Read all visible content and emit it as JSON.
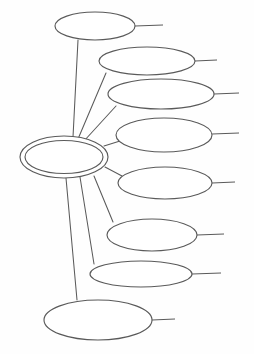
{
  "document": {
    "title": "Blank Concept Map",
    "type": "spider-diagram",
    "background_color": "#fefefe",
    "stroke_color": "#5a5a5a",
    "fill_color": "#ffffff"
  },
  "hub": {
    "label": "",
    "shape": "double-ellipse",
    "cx": 64,
    "cy": 157,
    "rx_outer": 44,
    "ry_outer": 21,
    "rx_inner": 39,
    "ry_inner": 16.5
  },
  "branches": [
    {
      "id": "branch-1",
      "label": "",
      "cx": 95,
      "cy": 26,
      "rx": 40,
      "ry": 14,
      "tail_x1": 135,
      "tail_y1": 26,
      "tail_x2": 163,
      "tail_y2": 25,
      "edge_x1": 73,
      "edge_y1": 137,
      "edge_x2": 78,
      "edge_y2": 40
    },
    {
      "id": "branch-2",
      "label": "",
      "cx": 147,
      "cy": 61,
      "rx": 48,
      "ry": 14,
      "tail_x1": 195,
      "tail_y1": 61,
      "tail_x2": 217,
      "tail_y2": 60,
      "edge_x1": 78,
      "edge_y1": 139,
      "edge_x2": 106,
      "edge_y2": 73
    },
    {
      "id": "branch-3",
      "label": "",
      "cx": 161,
      "cy": 94,
      "rx": 53,
      "ry": 15,
      "tail_x1": 214,
      "tail_y1": 94,
      "tail_x2": 239,
      "tail_y2": 93,
      "edge_x1": 84,
      "edge_y1": 141,
      "edge_x2": 116,
      "edge_y2": 106
    },
    {
      "id": "branch-4",
      "label": "",
      "cx": 164,
      "cy": 135,
      "rx": 48,
      "ry": 17,
      "tail_x1": 212,
      "tail_y1": 134,
      "tail_x2": 239,
      "tail_y2": 133,
      "edge_x1": 104,
      "edge_y1": 146,
      "edge_x2": 120,
      "edge_y2": 141
    },
    {
      "id": "branch-5",
      "label": "",
      "cx": 165,
      "cy": 183,
      "rx": 47,
      "ry": 16,
      "tail_x1": 212,
      "tail_y1": 183,
      "tail_x2": 235,
      "tail_y2": 182,
      "edge_x1": 105,
      "edge_y1": 167,
      "edge_x2": 122,
      "edge_y2": 176
    },
    {
      "id": "branch-6",
      "label": "",
      "cx": 152,
      "cy": 235,
      "rx": 45,
      "ry": 16,
      "tail_x1": 197,
      "tail_y1": 235,
      "tail_x2": 224,
      "tail_y2": 234,
      "edge_x1": 94,
      "edge_y1": 176,
      "edge_x2": 113,
      "edge_y2": 222
    },
    {
      "id": "branch-7",
      "label": "",
      "cx": 141,
      "cy": 274,
      "rx": 51,
      "ry": 13,
      "tail_x1": 192,
      "tail_y1": 274,
      "tail_x2": 221,
      "tail_y2": 273,
      "edge_x1": 80,
      "edge_y1": 177,
      "edge_x2": 94,
      "edge_y2": 264
    },
    {
      "id": "branch-8",
      "label": "",
      "cx": 98,
      "cy": 320,
      "rx": 54,
      "ry": 20,
      "tail_x1": 152,
      "tail_y1": 320,
      "tail_x2": 175,
      "tail_y2": 319,
      "edge_x1": 66,
      "edge_y1": 178,
      "edge_x2": 77,
      "edge_y2": 300
    }
  ]
}
